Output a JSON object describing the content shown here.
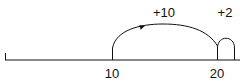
{
  "diagram": {
    "type": "number-line",
    "ticks": [
      {
        "label": "10",
        "value": 10
      },
      {
        "label": "20",
        "value": 20
      }
    ],
    "jumps": [
      {
        "label": "+10",
        "from": 10,
        "to": 20
      },
      {
        "label": "+2",
        "from": 20,
        "to": 22
      }
    ],
    "colors": {
      "stroke": "#111111",
      "background": "#ffffff"
    }
  }
}
